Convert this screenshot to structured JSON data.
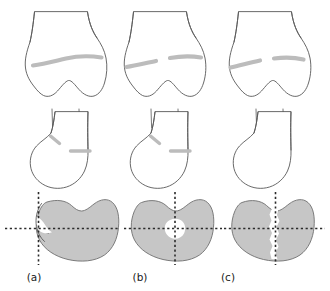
{
  "figure": {
    "background_color": "#ffffff",
    "width": 330,
    "height": 291,
    "outline_color": "#585858",
    "fracture_color": "#bcbcbc",
    "axial_fill_color": "#c6c6c6",
    "axial_void_color": "#ffffff",
    "crosshair_color": "#2b2b2b"
  },
  "rows": [
    {
      "id": "row-anteroposterior",
      "view": "anteroposterior"
    },
    {
      "id": "row-lateral",
      "view": "lateral"
    },
    {
      "id": "row-axial",
      "view": "axial-cross-section"
    }
  ],
  "panels": [
    {
      "key": "a",
      "label": "(a)",
      "ap_fracture": "continuous-transverse-line",
      "lateral_fracture": "two-segment-oblique-and-horizontal",
      "axial_feature": "medial-notch-crosshair-offset-left"
    },
    {
      "key": "b",
      "label": "(b)",
      "ap_fracture": "split-line-with-central-gap",
      "lateral_fracture": "two-segment-oblique-and-horizontal",
      "axial_feature": "central-round-void"
    },
    {
      "key": "c",
      "label": "(c)",
      "ap_fracture": "split-line-with-central-gap",
      "lateral_fracture": "none",
      "axial_feature": "vertical-jagged-cleft"
    }
  ]
}
